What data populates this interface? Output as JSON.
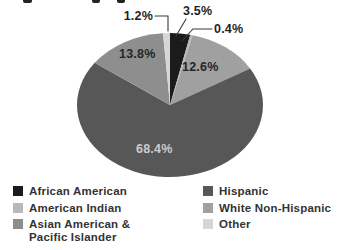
{
  "chart_data": {
    "type": "pie",
    "title": "",
    "direction": "clockwise",
    "start_angle_deg": 0,
    "legend_position": "bottom",
    "slices": [
      {
        "label": "African American",
        "value": 3.5,
        "callout": "3.5%",
        "color": "#1b1b1b"
      },
      {
        "label": "American Indian",
        "value": 0.4,
        "callout": "0.4%",
        "color": "#b8b8b8"
      },
      {
        "label": "White Non-Hispanic",
        "value": 12.6,
        "callout": "12.6%",
        "color": "#a0a0a0"
      },
      {
        "label": "Hispanic",
        "value": 68.4,
        "callout": "68.4%",
        "color": "#575757"
      },
      {
        "label": "Asian American & Pacific Islander",
        "value": 13.8,
        "callout": "13.8%",
        "color": "#8e8e8e"
      },
      {
        "label": "Other",
        "value": 1.2,
        "callout": "1.2%",
        "color": "#d6d6d6"
      }
    ]
  },
  "legend": {
    "column1": [
      {
        "label": "African American",
        "color": "#1b1b1b"
      },
      {
        "label": "American Indian",
        "color": "#b8b8b8"
      },
      {
        "label": "Asian American & Pacific Islander",
        "color": "#8e8e8e"
      }
    ],
    "column2": [
      {
        "label": "Hispanic",
        "color": "#575757"
      },
      {
        "label": "White Non-Hispanic",
        "color": "#a0a0a0"
      },
      {
        "label": "Other",
        "color": "#d6d6d6"
      }
    ]
  }
}
